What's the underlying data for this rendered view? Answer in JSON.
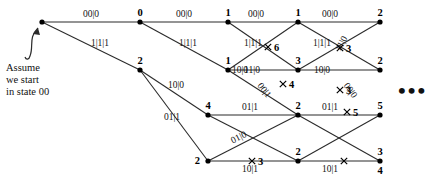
{
  "figure": {
    "background": "#ffffff",
    "line_color": "#2b2b2b",
    "text_color": "#111111",
    "width": 431,
    "height": 184
  },
  "annotation": {
    "line1": "Assume",
    "line2": "we start",
    "line3": "in state 00",
    "arrow_name": "curved-arrow-to-start-node"
  },
  "continuation": {
    "symbol": "•••"
  },
  "chart_data": {
    "type": "diagram",
    "columns_x": [
      42,
      140,
      228,
      298,
      380
    ],
    "rows_y": [
      22,
      70,
      115,
      161
    ],
    "nodes": [
      {
        "id": "n0-0",
        "col": 0,
        "row": 0,
        "x": 42,
        "y": 22,
        "label": "",
        "label_pos": "above"
      },
      {
        "id": "n1-0",
        "col": 1,
        "row": 0,
        "x": 140,
        "y": 22,
        "label": "0",
        "label_pos": "above"
      },
      {
        "id": "n1-1",
        "col": 1,
        "row": 1,
        "x": 140,
        "y": 70,
        "label": "2",
        "label_pos": "above"
      },
      {
        "id": "n2-0",
        "col": 2,
        "row": 0,
        "x": 228,
        "y": 22,
        "label": "1",
        "label_pos": "above"
      },
      {
        "id": "n2-1",
        "col": 2,
        "row": 1,
        "x": 228,
        "y": 70,
        "label": "1",
        "label_pos": "above"
      },
      {
        "id": "n2-2",
        "col": 2,
        "row": 2,
        "x": 208,
        "y": 115,
        "label": "4",
        "label_pos": "above"
      },
      {
        "id": "n2-3",
        "col": 2,
        "row": 3,
        "x": 208,
        "y": 161,
        "label": "2",
        "label_pos": "left"
      },
      {
        "id": "n3-0",
        "col": 3,
        "row": 0,
        "x": 298,
        "y": 22,
        "label": "1",
        "label_pos": "above"
      },
      {
        "id": "n3-1",
        "col": 3,
        "row": 1,
        "x": 298,
        "y": 70,
        "label": "3",
        "label_pos": "above"
      },
      {
        "id": "n3-2",
        "col": 3,
        "row": 2,
        "x": 298,
        "y": 115,
        "label": "2",
        "label_pos": "above"
      },
      {
        "id": "n3-3",
        "col": 3,
        "row": 3,
        "x": 298,
        "y": 161,
        "label": "2",
        "label_pos": "above"
      },
      {
        "id": "n4-0",
        "col": 4,
        "row": 0,
        "x": 380,
        "y": 22,
        "label": "2",
        "label_pos": "above"
      },
      {
        "id": "n4-1",
        "col": 4,
        "row": 1,
        "x": 380,
        "y": 70,
        "label": "2",
        "label_pos": "above"
      },
      {
        "id": "n4-2",
        "col": 4,
        "row": 2,
        "x": 380,
        "y": 115,
        "label": "5",
        "label_pos": "above"
      },
      {
        "id": "n4-3",
        "col": 4,
        "row": 3,
        "x": 380,
        "y": 161,
        "label": "3",
        "label_pos": "above"
      },
      {
        "id": "n4-3b",
        "col": 4,
        "row": 3,
        "x": 380,
        "y": 161,
        "label": "4",
        "label_pos": "below"
      }
    ],
    "edges": [
      {
        "from": "n0-0",
        "to": "n1-0",
        "label": "00|0",
        "lx": 91,
        "ly": 17,
        "rot": 0,
        "killed": false
      },
      {
        "from": "n0-0",
        "to": "n1-1",
        "label": "1|1|1",
        "lx": 100,
        "ly": 46,
        "rot": 0,
        "killed": false
      },
      {
        "from": "n1-0",
        "to": "n2-0",
        "label": "00|0",
        "lx": 184,
        "ly": 17,
        "rot": 0,
        "killed": false
      },
      {
        "from": "n1-0",
        "to": "n2-1",
        "label": "1|1|1",
        "lx": 188,
        "ly": 46,
        "rot": 0,
        "killed": false
      },
      {
        "from": "n1-1",
        "to": "n2-2",
        "label": "10|0",
        "lx": 176,
        "ly": 88,
        "rot": 0,
        "killed": false
      },
      {
        "from": "n1-1",
        "to": "n2-3",
        "label": "01|1",
        "lx": 172,
        "ly": 120,
        "rot": 0,
        "killed": false
      },
      {
        "from": "n2-0",
        "to": "n3-0",
        "label": "00|0",
        "lx": 256,
        "ly": 17,
        "rot": 0,
        "killed": false
      },
      {
        "from": "n2-0",
        "to": "n3-1",
        "label": "1|1|1",
        "lx": 253,
        "ly": 46,
        "rot": 0,
        "killed": false
      },
      {
        "from": "n2-1",
        "to": "n3-0",
        "label": "",
        "lx": 0,
        "ly": 0,
        "rot": 0,
        "killed": true,
        "kx": 268,
        "ky": 47,
        "kill_value": "6"
      },
      {
        "from": "n2-1",
        "to": "n3-1",
        "label": "11|0",
        "lx": 252,
        "ly": 73,
        "rot": 0,
        "killed": false
      },
      {
        "from": "n2-2",
        "to": "n3-2",
        "label": "01|1",
        "lx": 250,
        "ly": 110,
        "rot": 0,
        "killed": false
      },
      {
        "from": "n2-2",
        "to": "n3-3",
        "label": "00|1",
        "lx": 262,
        "ly": 92,
        "rot": 52,
        "killed": true,
        "kx": 283,
        "ky": 84,
        "kill_value": "4"
      },
      {
        "from": "n2-3",
        "to": "n3-2",
        "label": "01|0",
        "lx": 240,
        "ly": 140,
        "rot": -27,
        "killed": false
      },
      {
        "from": "n2-3",
        "to": "n3-3",
        "label": "10|1",
        "lx": 250,
        "ly": 172,
        "rot": 0,
        "killed": true,
        "kx": 252,
        "ky": 161,
        "kill_value": "3"
      },
      {
        "from": "n2-1",
        "to": "n3-2",
        "label": "10|0",
        "lx": 240,
        "ly": 73,
        "rot": 0,
        "killed": false
      },
      {
        "from": "n3-0",
        "to": "n4-0",
        "label": "00|0",
        "lx": 330,
        "ly": 17,
        "rot": 0,
        "killed": false
      },
      {
        "from": "n3-0",
        "to": "n4-1",
        "label": "1|1|1",
        "lx": 322,
        "ly": 46,
        "rot": 0,
        "killed": false
      },
      {
        "from": "n3-1",
        "to": "n4-0",
        "label": "11|0",
        "lx": 344,
        "ly": 45,
        "rot": -62,
        "killed": true,
        "kx": 340,
        "ky": 48,
        "kill_value": "3"
      },
      {
        "from": "n3-1",
        "to": "n4-1",
        "label": "10|0",
        "lx": 322,
        "ly": 73,
        "rot": 0,
        "killed": false
      },
      {
        "from": "n3-2",
        "to": "n4-2",
        "label": "01|1",
        "lx": 330,
        "ly": 110,
        "rot": 0,
        "killed": true,
        "kx": 347,
        "ky": 112,
        "kill_value": "5"
      },
      {
        "from": "n3-2",
        "to": "n4-3",
        "label": "",
        "lx": 0,
        "ly": 0,
        "rot": 0,
        "killed": false
      },
      {
        "from": "n3-3",
        "to": "n4-2",
        "label": "00|0",
        "lx": 348,
        "ly": 92,
        "rot": 55,
        "killed": true,
        "kx": 340,
        "ky": 90,
        "kill_value": "3"
      },
      {
        "from": "n3-3",
        "to": "n4-3",
        "label": "10|1",
        "lx": 330,
        "ly": 172,
        "rot": 0,
        "killed": true,
        "kx": 344,
        "ky": 161,
        "kill_value": ""
      }
    ],
    "edge_label_texts": [
      "00|0",
      "1|1|1",
      "10|0",
      "01|1",
      "11|0",
      "00|1",
      "01|0",
      "10|1"
    ],
    "kill_markers": [
      "6",
      "4",
      "3",
      "3",
      "5",
      "3"
    ]
  }
}
